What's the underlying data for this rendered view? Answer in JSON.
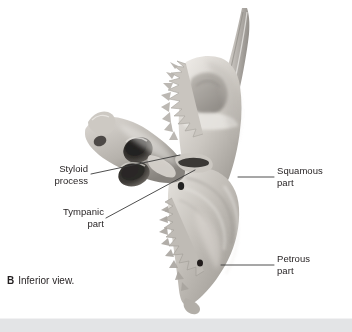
{
  "figure": {
    "caption_letter": "B",
    "caption_text": "Inferior view.",
    "background_color": "#ffffff",
    "bottom_bar_color": "#e3e4e6",
    "leader_line_color": "#3a3a3a"
  },
  "labels": {
    "styloid": {
      "line1": "Styloid",
      "line2": "process"
    },
    "tympanic": {
      "line1": "Tympanic",
      "line2": "part"
    },
    "squamous": {
      "line1": "Squamous",
      "line2": "part"
    },
    "petrous": {
      "line1": "Petrous",
      "line2": "part"
    }
  },
  "bone_colors": {
    "highlight": "#e8e6e2",
    "light": "#d8d5d0",
    "mid": "#bdb9b3",
    "shade": "#9d9993",
    "dark": "#7b7771",
    "deep": "#4e4b47",
    "foramen": "#2b2927"
  }
}
